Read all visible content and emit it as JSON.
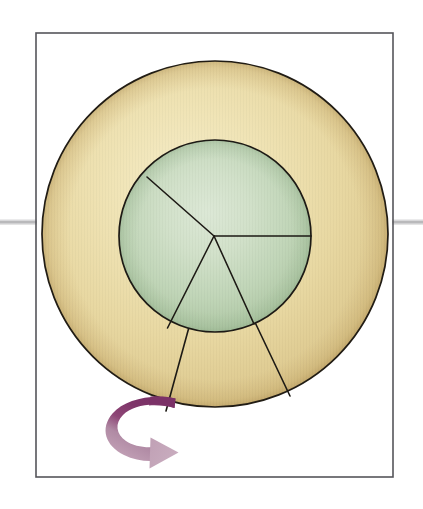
{
  "figure": {
    "title": "Rotating disk with sector and rotation arrow",
    "caption": "",
    "background_color": "#ffffff",
    "width": 423,
    "height": 509
  },
  "frame": {
    "name": "figure-border",
    "x": 36,
    "y": 33,
    "width": 357,
    "height": 444,
    "stroke_color": "#55555a",
    "stroke_width": 1.6,
    "fill": "#ffffff"
  },
  "axis_line": {
    "name": "horizontal-axis-line",
    "y": 222,
    "x_start": 0,
    "x_end": 423,
    "color": "#b9b9bb",
    "highlight_color": "#d8d8da",
    "thickness": 5
  },
  "outer_disk": {
    "name": "outer-disk",
    "cx": 215,
    "cy": 234,
    "r": 173,
    "fill_center": "#f0e3b4",
    "fill_mid": "#e9d9a4",
    "fill_edge": "#d6bd80",
    "stroke_color": "#211c14",
    "stroke_width": 1.7,
    "label": "tan annulus"
  },
  "inner_disk": {
    "name": "inner-disk",
    "cx": 215,
    "cy": 236,
    "r": 96,
    "fill_center": "#d5e3cf",
    "fill_mid": "#c3d7bb",
    "fill_edge": "#a9c4a1",
    "stroke_color": "#1d1a15",
    "stroke_width": 1.7,
    "label": "sage green core"
  },
  "center_point": {
    "name": "disk-center",
    "x": 214,
    "y": 236
  },
  "radial_lines": [
    {
      "name": "radial-line-upper-left",
      "x1": 214,
      "y1": 236,
      "x2": 147,
      "y2": 177,
      "stroke_color": "#1d1a15",
      "stroke_width": 1.6,
      "note": "center to green rim, upper-left"
    },
    {
      "name": "radial-line-right",
      "x1": 214,
      "y1": 236,
      "x2": 311,
      "y2": 236,
      "stroke_color": "#1d1a15",
      "stroke_width": 1.6,
      "note": "center to green rim, horizontal right"
    },
    {
      "name": "sector-edge-left",
      "x1": 214,
      "y1": 236,
      "x2": 166,
      "y2": 411,
      "stroke_color": "#1d1a15",
      "stroke_width": 1.6,
      "note": "center through green rim out to outer rim, lower-left"
    },
    {
      "name": "sector-edge-right",
      "x1": 214,
      "y1": 236,
      "x2": 290,
      "y2": 396,
      "stroke_color": "#1d1a15",
      "stroke_width": 1.6,
      "note": "center through green rim out to outer rim, lower-right"
    }
  ],
  "rotation_arrow": {
    "name": "rotation-arrow",
    "direction": "clockwise",
    "tail_color": "#7e3569",
    "mid_color": "#9d5a85",
    "head_color": "#c3a2b7",
    "tail_x": 168,
    "tail_y": 402,
    "head_x": 160,
    "head_y": 450,
    "description": "curved sweep arrow indicating disk rotation"
  },
  "legend": {
    "items": []
  }
}
